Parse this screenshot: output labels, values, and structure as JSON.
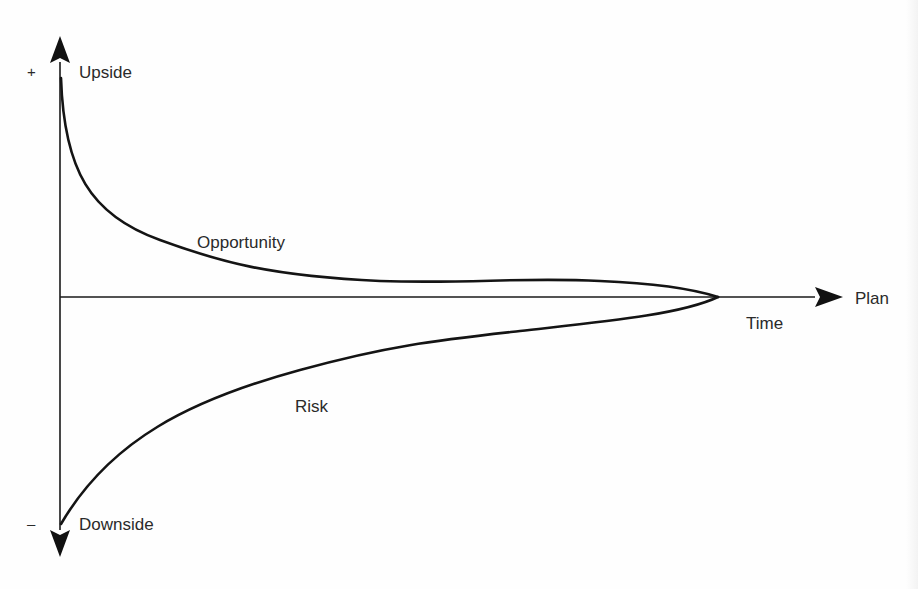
{
  "diagram": {
    "vertical_axis": {
      "top_label": "Upside",
      "bottom_label": "Downside",
      "plus_sign": "+",
      "minus_sign": "–"
    },
    "horizontal_axis": {
      "label": "Time",
      "end_label": "Plan"
    },
    "curves": [
      {
        "name": "opportunity",
        "label": "Opportunity",
        "side": "above-axis",
        "shape": "steep decay from upside converging to plan"
      },
      {
        "name": "risk",
        "label": "Risk",
        "side": "below-axis",
        "shape": "rising from downside converging to plan"
      }
    ],
    "colors": {
      "line": "#141414",
      "text": "#2a2a2a",
      "background": "#fefefe"
    }
  }
}
